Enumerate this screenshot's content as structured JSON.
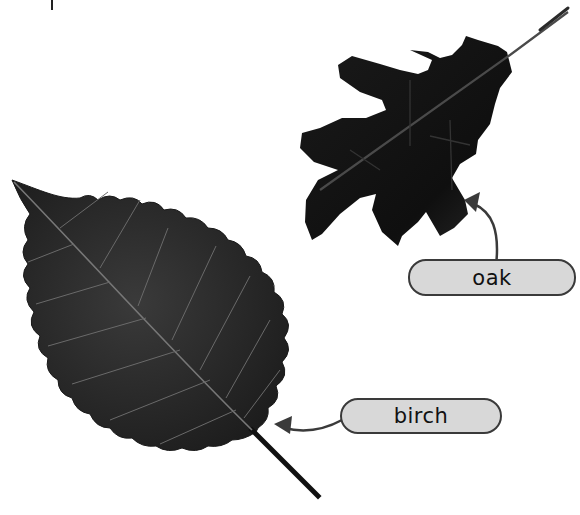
{
  "diagram": {
    "labels": [
      {
        "id": "oak",
        "text": "oak"
      },
      {
        "id": "birch",
        "text": "birch"
      }
    ],
    "colors": {
      "label_fill": "#d8d8d8",
      "label_border": "#3a3a3a",
      "arrow": "#3a3a3a",
      "leaf": "#1a1a1a"
    }
  }
}
